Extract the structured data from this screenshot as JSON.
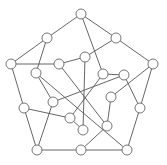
{
  "diagram": {
    "type": "graph",
    "node_radius": 5,
    "colors": {
      "edge": "#555555",
      "node_stroke": "#666666",
      "node_fill": "#ffffff",
      "background": "#ffffff"
    },
    "nodes": [
      {
        "id": 0,
        "x": 81,
        "y": 14
      },
      {
        "id": 1,
        "x": 116,
        "y": 38
      },
      {
        "id": 2,
        "x": 153,
        "y": 64
      },
      {
        "id": 3,
        "x": 140,
        "y": 108
      },
      {
        "id": 4,
        "x": 127,
        "y": 150
      },
      {
        "id": 5,
        "x": 81,
        "y": 150
      },
      {
        "id": 6,
        "x": 37,
        "y": 150
      },
      {
        "id": 7,
        "x": 24,
        "y": 108
      },
      {
        "id": 8,
        "x": 11,
        "y": 64
      },
      {
        "id": 9,
        "x": 47,
        "y": 38
      },
      {
        "id": 10,
        "x": 85,
        "y": 57
      },
      {
        "id": 11,
        "x": 59,
        "y": 64
      },
      {
        "id": 12,
        "x": 36,
        "y": 73
      },
      {
        "id": 13,
        "x": 103,
        "y": 74
      },
      {
        "id": 14,
        "x": 124,
        "y": 75
      },
      {
        "id": 15,
        "x": 111,
        "y": 97
      },
      {
        "id": 16,
        "x": 53,
        "y": 102
      },
      {
        "id": 17,
        "x": 70,
        "y": 118
      },
      {
        "id": 18,
        "x": 107,
        "y": 126
      },
      {
        "id": 19,
        "x": 83,
        "y": 130
      }
    ],
    "edges": [
      [
        0,
        1
      ],
      [
        1,
        2
      ],
      [
        2,
        3
      ],
      [
        3,
        4
      ],
      [
        4,
        5
      ],
      [
        5,
        6
      ],
      [
        6,
        7
      ],
      [
        7,
        8
      ],
      [
        8,
        9
      ],
      [
        9,
        0
      ],
      [
        0,
        13
      ],
      [
        9,
        12
      ],
      [
        1,
        10
      ],
      [
        8,
        11
      ],
      [
        11,
        10
      ],
      [
        10,
        19
      ],
      [
        12,
        4
      ],
      [
        12,
        16
      ],
      [
        11,
        18
      ],
      [
        16,
        14
      ],
      [
        13,
        14
      ],
      [
        2,
        15
      ],
      [
        14,
        3
      ],
      [
        15,
        18
      ],
      [
        13,
        17
      ],
      [
        7,
        17
      ],
      [
        16,
        6
      ],
      [
        5,
        18
      ],
      [
        17,
        19
      ]
    ]
  }
}
